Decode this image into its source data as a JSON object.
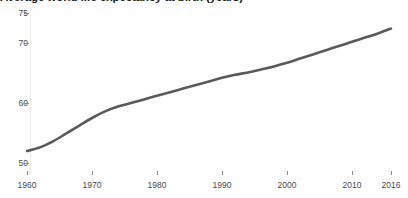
{
  "chart_data": {
    "type": "line",
    "title": "Average world life expectancy at birth (years)",
    "xlabel": "",
    "ylabel": "",
    "grid": false,
    "legend": false,
    "line_color": "#5a5a5a",
    "axis_text_color": "#4a4a4a",
    "xlim": [
      1960,
      2016
    ],
    "ylim": [
      48,
      76
    ],
    "xticks": [
      1960,
      1970,
      1980,
      1990,
      2000,
      2010,
      2016
    ],
    "xtick_labels": [
      "1960",
      "1970",
      "1980",
      "1990",
      "2000",
      "2010",
      "2016"
    ],
    "yticks": [
      50,
      60,
      70,
      75
    ],
    "ytick_labels": [
      "50",
      "60",
      "70",
      "75"
    ],
    "series": [
      {
        "name": "Average world life expectancy at birth",
        "x": [
          1960,
          1962,
          1964,
          1966,
          1968,
          1970,
          1972,
          1974,
          1976,
          1978,
          1980,
          1982,
          1984,
          1986,
          1988,
          1990,
          1992,
          1994,
          1996,
          1998,
          2000,
          2002,
          2004,
          2006,
          2008,
          2010,
          2012,
          2014,
          2016
        ],
        "values": [
          52.0,
          52.6,
          53.6,
          54.9,
          56.2,
          57.5,
          58.6,
          59.4,
          60.0,
          60.6,
          61.2,
          61.8,
          62.4,
          63.0,
          63.6,
          64.2,
          64.7,
          65.1,
          65.6,
          66.1,
          66.7,
          67.4,
          68.1,
          68.8,
          69.5,
          70.2,
          70.9,
          71.6,
          72.4
        ]
      }
    ]
  }
}
